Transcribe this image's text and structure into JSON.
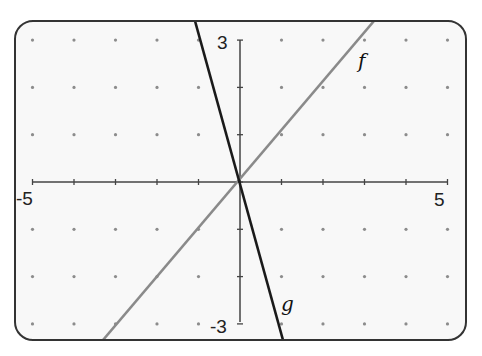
{
  "chart_data": {
    "type": "line",
    "title": "",
    "xlabel": "",
    "ylabel": "",
    "xlim": [
      -5,
      5
    ],
    "ylim": [
      -3,
      3
    ],
    "x_tick_labels": [
      "-5",
      "5"
    ],
    "y_tick_labels": [
      "3",
      "-3"
    ],
    "x_ticks": [
      -5,
      -4,
      -3,
      -2,
      -1,
      0,
      1,
      2,
      3,
      4,
      5
    ],
    "y_ticks": [
      -3,
      -2,
      -1,
      0,
      1,
      2,
      3
    ],
    "grid": "dots at integer lattice points",
    "legend": "none (curves labeled inline)",
    "series": [
      {
        "name": "f",
        "equation": "f(x) = x",
        "slope": 1,
        "intercept": 0,
        "color": "#8a8a8a",
        "points": [
          [
            -3.3,
            -3.3
          ],
          [
            0,
            0
          ],
          [
            3.25,
            3.4
          ]
        ]
      },
      {
        "name": "g",
        "equation": "g(x) = -3x",
        "slope": -3,
        "intercept": 0,
        "color": "#1a1a1a",
        "points": [
          [
            -1.1,
            3.4
          ],
          [
            0,
            0
          ],
          [
            1.05,
            -3.4
          ]
        ]
      }
    ],
    "annotations": [
      {
        "text": "f",
        "x": 3.1,
        "y": 2.5
      },
      {
        "text": "g",
        "x": 1.1,
        "y": -2.6
      }
    ]
  },
  "labels": {
    "x_min": "-5",
    "x_max": "5",
    "y_max": "3",
    "y_min": "-3",
    "f": "f",
    "g": "g"
  },
  "colors": {
    "frame": "#333333",
    "background": "#f7f7f7",
    "axis": "#444444",
    "dot": "#8c8c8c",
    "line_f": "#8a8a8a",
    "line_g": "#1a1a1a"
  }
}
